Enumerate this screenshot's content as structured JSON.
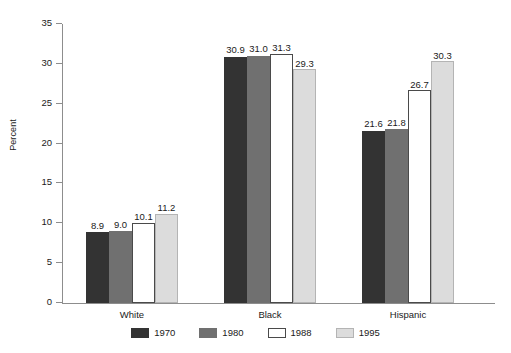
{
  "chart_data": {
    "type": "bar",
    "title": "",
    "xlabel": "",
    "ylabel": "Percent",
    "ylim": [
      0,
      35
    ],
    "yticks": [
      0,
      5,
      10,
      15,
      20,
      25,
      30,
      35
    ],
    "ytick_labels": [
      "0",
      "5",
      "10",
      "15",
      "20",
      "25",
      "30",
      "35"
    ],
    "grid": false,
    "legend_position": "bottom-center",
    "categories": [
      "White",
      "Black",
      "Hispanic"
    ],
    "series": [
      {
        "name": "1970",
        "color": "#333333",
        "values": [
          8.9,
          31.0,
          21.6
        ],
        "labels": [
          "8.9",
          "30.9",
          "21.6"
        ]
      },
      {
        "name": "1980",
        "color": "#707070",
        "values": [
          9.0,
          31.0,
          21.8
        ],
        "labels": [
          "9.0",
          "31.0",
          "21.8"
        ]
      },
      {
        "name": "1988",
        "color": "#ffffff",
        "values": [
          10.1,
          31.3,
          26.7
        ],
        "labels": [
          "10.1",
          "31.3",
          "26.7"
        ]
      },
      {
        "name": "1995",
        "color": "#dcdcdc",
        "values": [
          11.2,
          29.3,
          30.3
        ],
        "labels": [
          "11.2",
          "29.3",
          "30.3"
        ]
      }
    ],
    "series_corrected_values": [
      [
        8.9,
        30.9,
        21.6
      ],
      [
        9.0,
        31.0,
        21.8
      ],
      [
        10.1,
        31.3,
        26.7
      ],
      [
        11.2,
        29.3,
        30.3
      ]
    ]
  },
  "legend": {
    "items": [
      {
        "label": "1970",
        "color": "#333333"
      },
      {
        "label": "1980",
        "color": "#707070"
      },
      {
        "label": "1988",
        "color": "#ffffff"
      },
      {
        "label": "1995",
        "color": "#dcdcdc"
      }
    ]
  }
}
